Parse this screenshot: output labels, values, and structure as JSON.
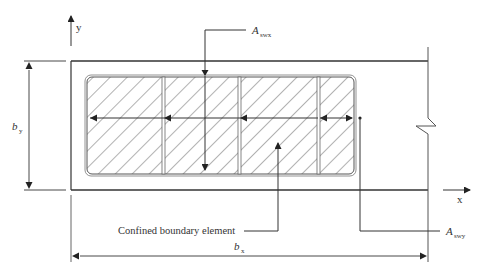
{
  "diagram": {
    "axes": {
      "y_label": "y",
      "x_label": "x"
    },
    "dimensions": {
      "by": {
        "main": "b",
        "sub": "y"
      },
      "bx": {
        "main": "b",
        "sub": "x"
      }
    },
    "callouts": {
      "aswx": {
        "main": "A",
        "sub": "swx"
      },
      "aswy": {
        "main": "A",
        "sub": "swy"
      },
      "confined": "Confined boundary element"
    },
    "cells": 4,
    "colors": {
      "line": "#333333",
      "hatch": "#555555",
      "background": "#ffffff"
    }
  }
}
